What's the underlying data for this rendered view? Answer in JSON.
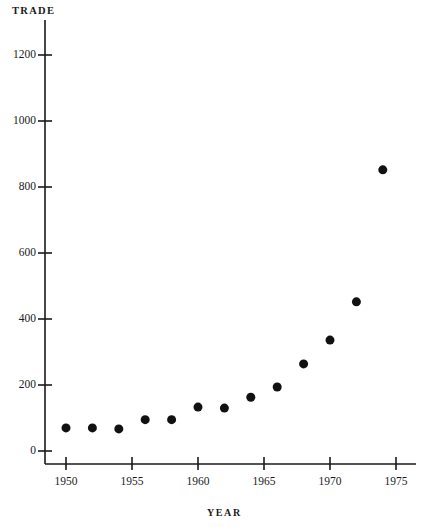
{
  "chart_data": {
    "type": "scatter",
    "title": "",
    "xlabel": "YEAR",
    "ylabel": "TRADE",
    "xlim": [
      1948.5,
      1976.5
    ],
    "ylim": [
      0,
      1280
    ],
    "grid": false,
    "legend": false,
    "x_ticks": [
      1950,
      1955,
      1960,
      1965,
      1970,
      1975
    ],
    "x_tick_labels": [
      "1950",
      "1955",
      "1960",
      "1965",
      "1970",
      "1975"
    ],
    "y_ticks": [
      0,
      200,
      400,
      600,
      800,
      1000,
      1200
    ],
    "y_tick_labels": [
      "0",
      "200",
      "400",
      "600",
      "800",
      "1000",
      "1200"
    ],
    "marker": "filled-circle",
    "marker_color": "#111111",
    "marker_size": 9,
    "x": [
      1950,
      1952,
      1954,
      1956,
      1958,
      1960,
      1962,
      1964,
      1966,
      1968,
      1970,
      1972,
      1974
    ],
    "values": [
      70,
      70,
      67,
      95,
      95,
      133,
      130,
      163,
      194,
      264,
      336,
      452,
      852
    ],
    "points": [
      {
        "x": 1950,
        "y": 70
      },
      {
        "x": 1952,
        "y": 70
      },
      {
        "x": 1954,
        "y": 67
      },
      {
        "x": 1956,
        "y": 95
      },
      {
        "x": 1958,
        "y": 95
      },
      {
        "x": 1960,
        "y": 133
      },
      {
        "x": 1962,
        "y": 130
      },
      {
        "x": 1964,
        "y": 163
      },
      {
        "x": 1966,
        "y": 194
      },
      {
        "x": 1968,
        "y": 264
      },
      {
        "x": 1970,
        "y": 336
      },
      {
        "x": 1972,
        "y": 452
      },
      {
        "x": 1974,
        "y": 852
      }
    ]
  },
  "axes": {
    "y_axis_title": "TRADE",
    "x_axis_title": "YEAR"
  }
}
